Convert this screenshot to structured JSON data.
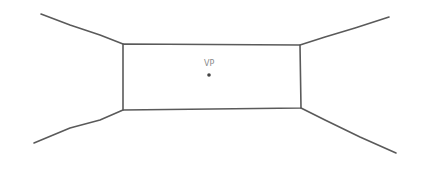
{
  "diagram": {
    "type": "one-point perspective sketch",
    "stroke_color": "#5a5a5a",
    "vanishing_point": {
      "label": "VP",
      "x": 209,
      "y": 75,
      "dot_color": "#444444"
    },
    "back_wall": {
      "top_left": [
        123,
        44
      ],
      "top_right": [
        300,
        45
      ],
      "bottom_right": [
        301,
        108
      ],
      "bottom_left": [
        123,
        110
      ]
    },
    "receding_lines": [
      {
        "name": "top-left-edge",
        "from": [
          123,
          44
        ],
        "to": [
          41,
          14
        ]
      },
      {
        "name": "top-right-edge",
        "from": [
          300,
          45
        ],
        "to": [
          389,
          17
        ]
      },
      {
        "name": "bottom-left-edge",
        "from": [
          123,
          110
        ],
        "to": [
          34,
          143
        ]
      },
      {
        "name": "bottom-right-edge",
        "from": [
          301,
          108
        ],
        "to": [
          396,
          153
        ]
      }
    ]
  }
}
